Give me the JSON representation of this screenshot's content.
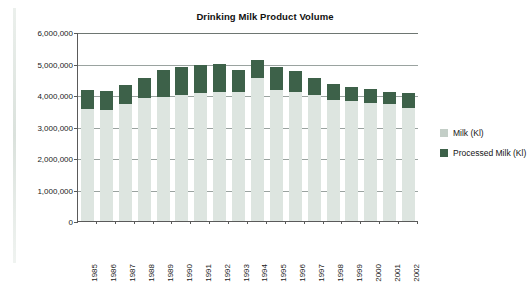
{
  "chart_data": {
    "type": "bar",
    "subtype": "stacked-column",
    "title": "Drinking Milk Product Volume",
    "xlabel": "",
    "ylabel": "",
    "ylim": [
      0,
      6000000
    ],
    "ytick_values": [
      6000000,
      5000000,
      4000000,
      3000000,
      2000000,
      1000000,
      0
    ],
    "ytick_labels": [
      "6,000,000",
      "5,000,000",
      "4,000,000",
      "3,000,000",
      "2,000,000",
      "1,000,000",
      "0"
    ],
    "grid": true,
    "legend_position": "right",
    "categories": [
      "1985",
      "1986",
      "1987",
      "1988",
      "1989",
      "1990",
      "1991",
      "1992",
      "1993",
      "1994",
      "1995",
      "1996",
      "1997",
      "1998",
      "1999",
      "2000",
      "2001",
      "2002"
    ],
    "series": [
      {
        "name": "Milk (Kl)",
        "color": "#dde5e0",
        "values": [
          3550000,
          3520000,
          3700000,
          3900000,
          3950000,
          4000000,
          4050000,
          4100000,
          4100000,
          4550000,
          4150000,
          4100000,
          4000000,
          3850000,
          3800000,
          3750000,
          3700000,
          3600000
        ]
      },
      {
        "name": "Processed Milk (Kl)",
        "color": "#3d6149",
        "values": [
          620000,
          600000,
          620000,
          650000,
          830000,
          900000,
          900000,
          900000,
          700000,
          550000,
          750000,
          650000,
          550000,
          500000,
          450000,
          450000,
          400000,
          450000
        ]
      }
    ],
    "totals": [
      4170000,
      4120000,
      4320000,
      4550000,
      4780000,
      4900000,
      4950000,
      5000000,
      4800000,
      5100000,
      4900000,
      4750000,
      4550000,
      4350000,
      4250000,
      4200000,
      4100000,
      4050000
    ]
  },
  "legend": {
    "items": [
      {
        "label": "Milk (Kl)",
        "color": "#c3cec7",
        "swatch_class": "milk"
      },
      {
        "label": "Processed Milk (Kl)",
        "color": "#3d6149",
        "swatch_class": "processed"
      }
    ]
  },
  "colors": {
    "milk": "#dde5e0",
    "processed_milk": "#3d6149",
    "axis": "#5a5a5a",
    "gridline": "#9aa3a0",
    "text": "#1a1a1a",
    "background": "#ffffff"
  }
}
